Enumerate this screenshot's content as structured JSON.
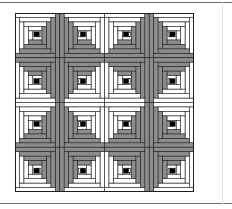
{
  "figure": {
    "title": "",
    "pattern": "log-cabin-quilt",
    "grid": {
      "rows": 4,
      "cols": 4
    },
    "colors": {
      "light": "#ffffff",
      "dark": "#8c8c8c",
      "center": "#000000",
      "outline": "#1e1e1e",
      "frame": "#6e6e6e"
    },
    "rings": 4,
    "dark_corner_by_position": [
      [
        "bottom-right",
        "bottom-left",
        "bottom-right",
        "bottom-left"
      ],
      [
        "top-right",
        "top-left",
        "top-right",
        "top-left"
      ],
      [
        "bottom-right",
        "bottom-left",
        "bottom-right",
        "bottom-left"
      ],
      [
        "top-right",
        "top-left",
        "top-right",
        "top-left"
      ]
    ]
  }
}
